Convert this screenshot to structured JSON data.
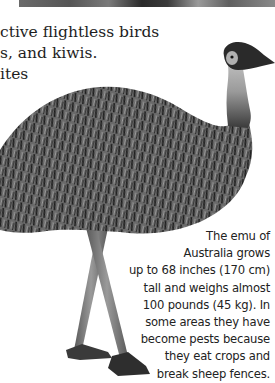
{
  "top_photo": {
    "description": "cropped photo edge"
  },
  "body_text": {
    "lines": [
      "ctive flightless birds",
      "s, and kiwis.",
      "ites"
    ]
  },
  "illustration": {
    "subject": "emu",
    "colors": {
      "feathers_dark": "#1e1e1e",
      "feathers_mid": "#5a5a5a",
      "feathers_light": "#9a9a9a",
      "legs": "#7d7d7d"
    }
  },
  "caption": {
    "lines": [
      "The emu of",
      "Australia grows",
      "up to 68 inches (170 cm)",
      "tall and weighs almost",
      "100 pounds (45 kg). In",
      "some areas they have",
      "become pests because",
      "they eat crops and",
      "break sheep fences."
    ]
  }
}
